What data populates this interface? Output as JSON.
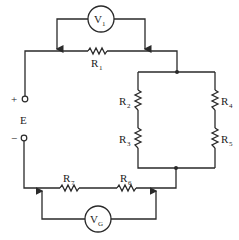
{
  "diagram": {
    "type": "circuit",
    "source": {
      "label": "E",
      "plus": "+",
      "minus": "−"
    },
    "meters": [
      {
        "id": "V1",
        "main": "V",
        "sub": "1"
      },
      {
        "id": "VG",
        "main": "V",
        "sub": "G"
      }
    ],
    "resistors": [
      {
        "id": "R1",
        "main": "R",
        "sub": "1"
      },
      {
        "id": "R2",
        "main": "R",
        "sub": "2"
      },
      {
        "id": "R3",
        "main": "R",
        "sub": "3"
      },
      {
        "id": "R4",
        "main": "R",
        "sub": "4"
      },
      {
        "id": "R5",
        "main": "R",
        "sub": "5"
      },
      {
        "id": "R6",
        "main": "R",
        "sub": "6"
      },
      {
        "id": "R7",
        "main": "R",
        "sub": "7"
      }
    ]
  }
}
